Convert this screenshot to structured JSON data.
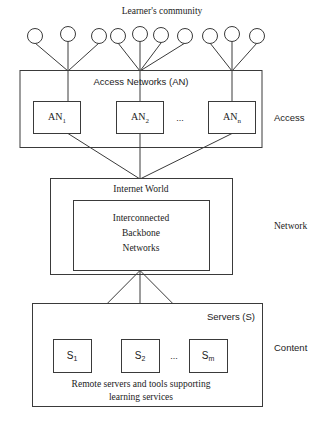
{
  "figure": {
    "top_label": "Learner's community",
    "layers": [
      {
        "id": "access",
        "side_label": "Access",
        "header": "Access Networks (AN)",
        "nodes": [
          {
            "base": "AN",
            "sub": "1"
          },
          {
            "base": "AN",
            "sub": "2"
          },
          {
            "base": "AN",
            "sub": "n"
          }
        ],
        "ellipsis": "..."
      },
      {
        "id": "network",
        "side_label": "Network",
        "header": "Internet World",
        "inner_lines": [
          "Interconnected",
          "Backbone",
          "Networks"
        ]
      },
      {
        "id": "content",
        "side_label": "Content",
        "header": "Servers (S)",
        "nodes": [
          {
            "base": "S",
            "sub": "1"
          },
          {
            "base": "S",
            "sub": "2"
          },
          {
            "base": "S",
            "sub": "m"
          }
        ],
        "ellipsis": "...",
        "caption_lines": [
          "Remote servers and tools supporting",
          "learning services"
        ]
      }
    ],
    "learner_clusters": [
      {
        "count": 3
      },
      {
        "count": 4
      },
      {
        "count": 3
      }
    ],
    "colors": {
      "stroke": "#3a3a3a",
      "text": "#1b1b1b",
      "background": "#ffffff"
    }
  }
}
